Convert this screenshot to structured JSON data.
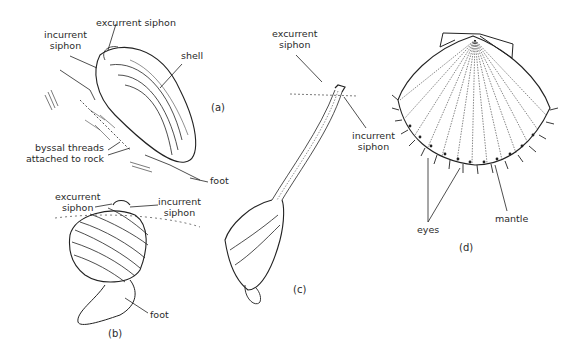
{
  "figure": {
    "panels": [
      {
        "id": "a",
        "panel_label": "(a)",
        "labels": {
          "excurrent_siphon": "excurrent siphon",
          "incurrent_siphon_1": "incurrent",
          "incurrent_siphon_2": "siphon",
          "shell": "shell",
          "byssal_1": "byssal threads",
          "byssal_2": "attached to rock",
          "foot": "foot"
        }
      },
      {
        "id": "b",
        "panel_label": "(b)",
        "labels": {
          "excurrent_1": "excurrent",
          "excurrent_2": "siphon",
          "incurrent_1": "incurrent",
          "incurrent_2": "siphon",
          "foot": "foot"
        }
      },
      {
        "id": "c",
        "panel_label": "(c)",
        "labels": {
          "excurrent_1": "excurrent",
          "excurrent_2": "siphon",
          "incurrent_1": "incurrent",
          "incurrent_2": "siphon"
        }
      },
      {
        "id": "d",
        "panel_label": "(d)",
        "labels": {
          "eyes": "eyes",
          "mantle": "mantle"
        }
      }
    ]
  }
}
